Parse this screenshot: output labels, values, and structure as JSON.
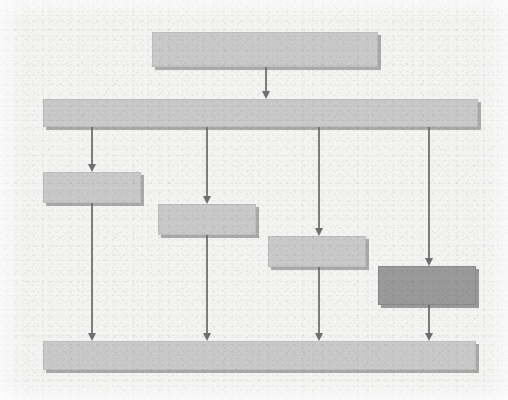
{
  "document": {
    "kind": "flowchart-diagram",
    "title": "",
    "background_color": "#f3f3f2",
    "node_fill_color": "#c9c9c9",
    "node_highlight_color": "#9a9a9a",
    "connector_color": "#7d7d7d",
    "shadow_color": "#6e6e6e",
    "legibility_note": "Scanned low-resolution diagram; box label text is not legible in the source pixels."
  },
  "nodes": [
    {
      "id": "node-top",
      "name": "top-process-box",
      "label": "",
      "style": "normal",
      "x": 152,
      "y": 32,
      "w": 226,
      "h": 35
    },
    {
      "id": "node-bus-upper",
      "name": "upper-wide-bar",
      "label": "",
      "style": "normal",
      "x": 43,
      "y": 99,
      "w": 435,
      "h": 28
    },
    {
      "id": "node-branch-1",
      "name": "branch-box-1",
      "label": "",
      "style": "normal",
      "x": 43,
      "y": 172,
      "w": 98,
      "h": 31
    },
    {
      "id": "node-branch-2",
      "name": "branch-box-2",
      "label": "",
      "style": "normal",
      "x": 158,
      "y": 204,
      "w": 98,
      "h": 31
    },
    {
      "id": "node-branch-3",
      "name": "branch-box-3",
      "label": "",
      "style": "normal",
      "x": 268,
      "y": 236,
      "w": 98,
      "h": 31
    },
    {
      "id": "node-branch-4",
      "name": "branch-box-4-highlighted",
      "label": "",
      "style": "highlight",
      "x": 378,
      "y": 266,
      "w": 98,
      "h": 39
    },
    {
      "id": "node-bus-lower",
      "name": "lower-wide-bar",
      "label": "",
      "style": "normal",
      "x": 43,
      "y": 341,
      "w": 433,
      "h": 29
    }
  ],
  "connectors": [
    {
      "id": "c1",
      "name": "arrow-top-to-upper-bar",
      "x": 265,
      "y1": 67,
      "y2": 99
    },
    {
      "id": "c2",
      "name": "arrow-upper-bar-to-branch-1",
      "x": 91,
      "y1": 127,
      "y2": 172
    },
    {
      "id": "c3",
      "name": "arrow-upper-bar-to-branch-2",
      "x": 206,
      "y1": 127,
      "y2": 204
    },
    {
      "id": "c4",
      "name": "arrow-upper-bar-to-branch-3",
      "x": 318,
      "y1": 127,
      "y2": 236
    },
    {
      "id": "c5",
      "name": "arrow-upper-bar-to-branch-4",
      "x": 428,
      "y1": 127,
      "y2": 266
    },
    {
      "id": "c6",
      "name": "arrow-branch-1-to-lower-bar",
      "x": 91,
      "y1": 203,
      "y2": 341
    },
    {
      "id": "c7",
      "name": "arrow-branch-2-to-lower-bar",
      "x": 206,
      "y1": 235,
      "y2": 341
    },
    {
      "id": "c8",
      "name": "arrow-branch-3-to-lower-bar",
      "x": 318,
      "y1": 267,
      "y2": 341
    },
    {
      "id": "c9",
      "name": "arrow-branch-4-to-lower-bar",
      "x": 428,
      "y1": 305,
      "y2": 341
    }
  ]
}
